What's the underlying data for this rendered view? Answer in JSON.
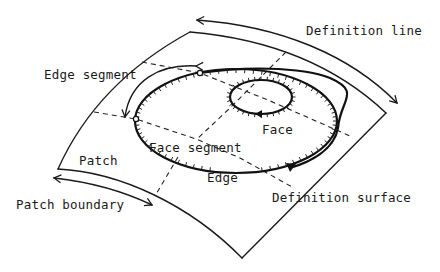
{
  "diagram": {
    "labels": {
      "definition_line": "Definition line",
      "edge_segment": "Edge segment",
      "face": "Face",
      "face_segment": "Face segment",
      "patch": "Patch",
      "edge": "Edge",
      "patch_boundary": "Patch boundary",
      "definition_surface": "Definition surface"
    },
    "colors": {
      "line": "#1a1a1a",
      "background": "#ffffff"
    }
  }
}
